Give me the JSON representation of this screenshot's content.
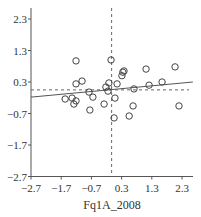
{
  "chart_data": {
    "type": "scatter",
    "title": "",
    "xlabel": "Fq1A_2008",
    "ylabel": "",
    "xlim": [
      -2.7,
      2.66
    ],
    "ylim": [
      -2.7,
      2.6
    ],
    "x_ticks": [
      "-2.7",
      "-1.7",
      "-0.7",
      "0.3",
      "1.3",
      "2.3"
    ],
    "y_ticks": [
      "2.3",
      "1.3",
      "0.3",
      "-0.7",
      "-1.7",
      "-2.7"
    ],
    "grid": false,
    "points": [
      [
        -1.21,
        0.97
      ],
      [
        -0.05,
        1.0
      ],
      [
        0.38,
        0.65
      ],
      [
        0.34,
        0.61
      ],
      [
        0.31,
        0.5
      ],
      [
        -1.21,
        0.24
      ],
      [
        -1.01,
        0.33
      ],
      [
        -0.12,
        0.27
      ],
      [
        0.15,
        0.24
      ],
      [
        -0.22,
        0.14
      ],
      [
        -0.15,
        0.01
      ],
      [
        -0.78,
        -0.02
      ],
      [
        -0.65,
        -0.18
      ],
      [
        -1.57,
        -0.24
      ],
      [
        -1.34,
        -0.21
      ],
      [
        -1.21,
        -0.3
      ],
      [
        -1.28,
        -0.4
      ],
      [
        0.08,
        -0.21
      ],
      [
        -0.28,
        -0.4
      ],
      [
        -0.75,
        -0.59
      ],
      [
        0.05,
        -0.84
      ],
      [
        1.11,
        0.71
      ],
      [
        2.07,
        0.78
      ],
      [
        1.21,
        0.2
      ],
      [
        1.64,
        0.3
      ],
      [
        0.71,
        0.08
      ],
      [
        0.68,
        -0.46
      ],
      [
        2.2,
        -0.46
      ],
      [
        0.55,
        -0.78
      ]
    ],
    "regression_line": {
      "x": [
        -2.7,
        2.66
      ],
      "y": [
        -0.18,
        0.3
      ]
    },
    "reference_lines": {
      "vertical_x": -0.03,
      "horizontal_y": 0.05,
      "style": "dashed"
    },
    "colors": {
      "axis": "#555555",
      "points": "#444444",
      "line": "#555555"
    }
  }
}
